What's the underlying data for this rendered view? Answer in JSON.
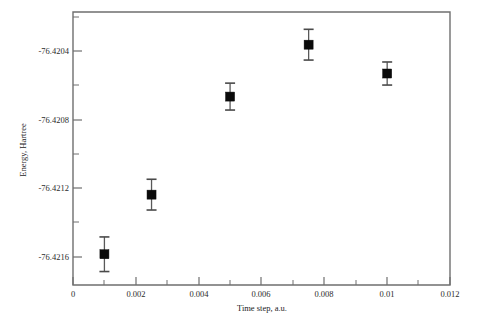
{
  "chart_data": {
    "type": "scatter",
    "title": "",
    "xlabel": "Time step, a.u.",
    "ylabel": "Energy, Hartree",
    "xlim": [
      0,
      0.012
    ],
    "ylim": [
      -76.42168,
      -76.42026
    ],
    "grid": false,
    "legend": null,
    "x_ticks": [
      {
        "value": 0,
        "label": "0"
      },
      {
        "value": 0.002,
        "label": "0.002"
      },
      {
        "value": 0.004,
        "label": "0.004"
      },
      {
        "value": 0.006,
        "label": "0.006"
      },
      {
        "value": 0.008,
        "label": "0.008"
      },
      {
        "value": 0.01,
        "label": "0.01"
      },
      {
        "value": 0.012,
        "label": "0.012"
      }
    ],
    "x_minor_ticks": [
      0.001,
      0.003,
      0.005,
      0.007,
      0.009,
      0.011
    ],
    "y_ticks": [
      {
        "value": -76.4204,
        "label": "-76.4204"
      },
      {
        "value": -76.4208,
        "label": "-76.4208"
      },
      {
        "value": -76.4212,
        "label": "-76.4212"
      },
      {
        "value": -76.4216,
        "label": "-76.4216"
      }
    ],
    "y_minor_ticks": [
      -76.4202,
      -76.4206,
      -76.421,
      -76.4214
    ],
    "marker": {
      "shape": "square",
      "color": "#0a0a0a",
      "size_px": 9
    },
    "errorbar_color": "#595959",
    "series": [
      {
        "name": "Energy vs time step",
        "x": [
          0.001,
          0.0025,
          0.005,
          0.0075,
          0.01
        ],
        "y": [
          -76.42152,
          -76.42121,
          -76.4207,
          -76.42043,
          -76.42058
        ],
        "yerr": [
          9e-05,
          8e-05,
          7e-05,
          8e-05,
          6e-05
        ]
      }
    ]
  }
}
